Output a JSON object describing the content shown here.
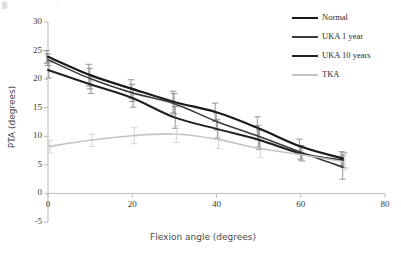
{
  "chart_data": {
    "type": "line",
    "title": "",
    "xlabel": "Flexion angle (degrees)",
    "ylabel": "PTA (degrees)",
    "xlim": [
      0,
      80
    ],
    "ylim": [
      -5,
      30
    ],
    "xticks": [
      0,
      20,
      40,
      60,
      80
    ],
    "yticks": [
      -5,
      0,
      5,
      10,
      15,
      20,
      25,
      30
    ],
    "xtick_labels": [
      "0",
      "20",
      "40",
      "60",
      "80"
    ],
    "ytick_labels": [
      "-5",
      "0",
      "5",
      "10",
      "15",
      "20",
      "25",
      "30"
    ],
    "grid": false,
    "legend_position": "top-right",
    "x": [
      0,
      10,
      20,
      30,
      40,
      50,
      60,
      70
    ],
    "series": [
      {
        "name": "Normal",
        "color": "#1a1a1a",
        "width": 2.2,
        "values": [
          23.9,
          20.7,
          18.3,
          16.0,
          14.2,
          11.4,
          8.2,
          6.1
        ],
        "errors": [
          1.1,
          1.9,
          1.6,
          1.9,
          1.6,
          2.0,
          1.3,
          1.2
        ]
      },
      {
        "name": "UKA 1 year",
        "color": "#3a3a3a",
        "width": 1.6,
        "values": [
          23.4,
          20.1,
          17.6,
          15.7,
          12.6,
          10.0,
          7.2,
          4.6
        ],
        "errors": [
          1.0,
          1.8,
          1.5,
          1.8,
          1.5,
          1.9,
          1.2,
          2.1
        ]
      },
      {
        "name": "UKA 10 years",
        "color": "#202020",
        "width": 2.0,
        "values": [
          21.6,
          19.1,
          16.7,
          13.3,
          11.3,
          9.4,
          7.0,
          5.8
        ],
        "errors": [
          1.4,
          1.6,
          1.6,
          1.9,
          1.6,
          1.7,
          1.3,
          1.3
        ]
      },
      {
        "name": "TKA",
        "color": "#c4c4c4",
        "width": 1.6,
        "values": [
          8.2,
          9.3,
          10.1,
          10.4,
          9.5,
          7.9,
          6.8,
          5.6
        ],
        "errors": [
          1.1,
          1.1,
          1.4,
          1.5,
          1.6,
          1.6,
          1.2,
          1.4
        ]
      }
    ]
  },
  "legend": {
    "items": [
      {
        "label": "Normal"
      },
      {
        "label": "UKA 1 year"
      },
      {
        "label": "UKA 10 years"
      },
      {
        "label": "TKA"
      }
    ]
  },
  "axis_titles": {
    "x": "Flexion angle (degrees)",
    "y": "PTA (degrees)"
  }
}
